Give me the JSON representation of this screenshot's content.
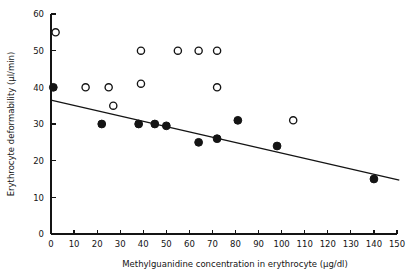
{
  "chart_data": {
    "type": "scatter",
    "title": "",
    "xlabel": "Methylguanidine concentration in erythrocyte (µg/dl)",
    "ylabel": "Erythrocyte deformability (µl/min)",
    "xlim": [
      0,
      150
    ],
    "ylim": [
      0,
      60
    ],
    "xticks": [
      0,
      10,
      20,
      30,
      40,
      50,
      60,
      70,
      80,
      90,
      100,
      110,
      120,
      130,
      140,
      150
    ],
    "yticks": [
      0,
      10,
      20,
      30,
      40,
      50,
      60
    ],
    "grid": false,
    "legend": "none",
    "series": [
      {
        "name": "open-circles",
        "marker": "open-circle",
        "color": "#ffffff",
        "edge_color": "#141414",
        "points": [
          {
            "x": 2,
            "y": 55
          },
          {
            "x": 15,
            "y": 40
          },
          {
            "x": 25,
            "y": 40
          },
          {
            "x": 27,
            "y": 35
          },
          {
            "x": 39,
            "y": 50
          },
          {
            "x": 39,
            "y": 41
          },
          {
            "x": 55,
            "y": 50
          },
          {
            "x": 64,
            "y": 50
          },
          {
            "x": 72,
            "y": 50
          },
          {
            "x": 72,
            "y": 40
          },
          {
            "x": 105,
            "y": 31
          }
        ]
      },
      {
        "name": "filled-circles",
        "marker": "filled-circle",
        "color": "#141414",
        "edge_color": "#141414",
        "points": [
          {
            "x": 1,
            "y": 40
          },
          {
            "x": 22,
            "y": 30
          },
          {
            "x": 38,
            "y": 30
          },
          {
            "x": 45,
            "y": 30
          },
          {
            "x": 50,
            "y": 29.5
          },
          {
            "x": 64,
            "y": 25
          },
          {
            "x": 72,
            "y": 26
          },
          {
            "x": 81,
            "y": 31
          },
          {
            "x": 98,
            "y": 24
          },
          {
            "x": 140,
            "y": 15
          }
        ]
      }
    ],
    "trend_line": {
      "name": "regression-line",
      "x_start": 0,
      "y_start": 36.5,
      "x_end": 151,
      "y_end": 14.7,
      "color": "#141414"
    }
  }
}
